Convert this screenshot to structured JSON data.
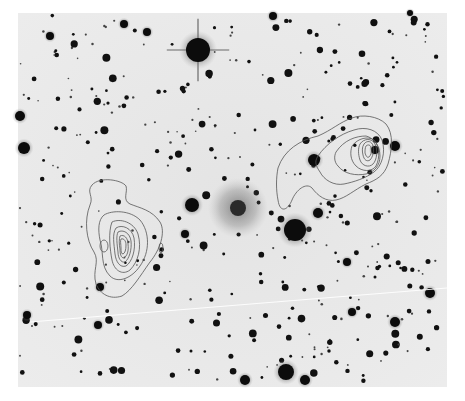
{
  "figure": {
    "plate": {
      "x": 18,
      "y": 13,
      "width": 429,
      "height": 374,
      "background": "#e9e9e9",
      "star_color": "#111111",
      "contour_color": "#555555"
    },
    "bright_stars": [
      {
        "x": 198,
        "y": 50,
        "r": 12,
        "spikes": true
      },
      {
        "x": 295,
        "y": 230,
        "r": 11
      },
      {
        "x": 238,
        "y": 208,
        "r": 10,
        "diffuse": true
      },
      {
        "x": 286,
        "y": 372,
        "r": 8
      },
      {
        "x": 245,
        "y": 380,
        "r": 5
      },
      {
        "x": 305,
        "y": 380,
        "r": 5
      },
      {
        "x": 20,
        "y": 116,
        "r": 5
      },
      {
        "x": 24,
        "y": 148,
        "r": 6
      },
      {
        "x": 192,
        "y": 205,
        "r": 7
      },
      {
        "x": 314,
        "y": 160,
        "r": 6
      },
      {
        "x": 395,
        "y": 146,
        "r": 5
      },
      {
        "x": 430,
        "y": 293,
        "r": 5
      },
      {
        "x": 395,
        "y": 322,
        "r": 5
      },
      {
        "x": 352,
        "y": 312,
        "r": 4
      },
      {
        "x": 273,
        "y": 16,
        "r": 4
      },
      {
        "x": 124,
        "y": 24,
        "r": 4
      },
      {
        "x": 147,
        "y": 32,
        "r": 4
      },
      {
        "x": 50,
        "y": 36,
        "r": 4
      },
      {
        "x": 410,
        "y": 13,
        "r": 3
      },
      {
        "x": 185,
        "y": 234,
        "r": 4
      },
      {
        "x": 347,
        "y": 262,
        "r": 4
      },
      {
        "x": 100,
        "y": 287,
        "r": 4
      },
      {
        "x": 27,
        "y": 315,
        "r": 4
      },
      {
        "x": 98,
        "y": 325,
        "r": 4
      },
      {
        "x": 318,
        "y": 213,
        "r": 5
      },
      {
        "x": 375,
        "y": 150,
        "r": 4
      }
    ],
    "lobes": [
      {
        "name": "western-lobe",
        "cx": 125,
        "cy": 248
      },
      {
        "name": "eastern-lobe",
        "cx": 370,
        "cy": 152
      }
    ],
    "satellite_trail": {
      "x1": 30,
      "y1": 322,
      "x2": 447,
      "y2": 288
    }
  }
}
